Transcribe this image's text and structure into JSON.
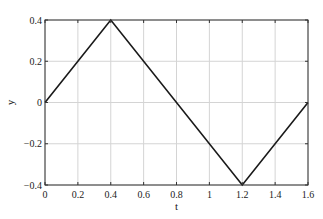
{
  "chart_data": {
    "type": "line",
    "title": "",
    "xlabel": "t",
    "ylabel": "y",
    "xlim": [
      0,
      1.6
    ],
    "ylim": [
      -0.4,
      0.4
    ],
    "grid": true,
    "legend": null,
    "xticks": [
      0,
      0.2,
      0.4,
      0.6,
      0.8,
      1,
      1.2,
      1.4,
      1.6
    ],
    "xtick_labels": [
      "0",
      "0.2",
      "0.4",
      "0.6",
      "0.8",
      "1",
      "1.2",
      "1.4",
      "1.6"
    ],
    "yticks": [
      0.4,
      0.2,
      0,
      -0.2,
      -0.4
    ],
    "ytick_labels": [
      "0.4",
      "0.2",
      "0",
      "−0.2",
      "−0.4"
    ],
    "series": [
      {
        "name": "y(t)",
        "color": "#1a1a1a",
        "x": [
          0,
          0.4,
          1.2,
          1.6
        ],
        "y": [
          0,
          0.4,
          -0.4,
          0
        ]
      }
    ]
  },
  "colors": {
    "grid": "#d4d4d4",
    "axes": "#333333",
    "line": "#1a1a1a",
    "background": "#ffffff"
  }
}
